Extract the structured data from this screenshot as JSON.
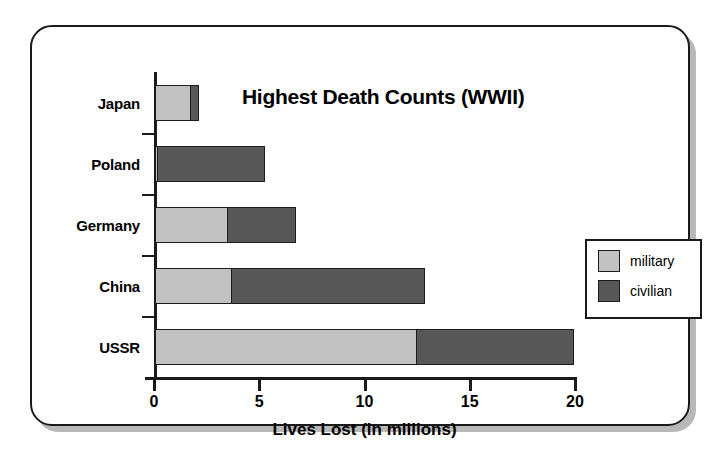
{
  "chart_data": {
    "type": "bar",
    "orientation": "horizontal",
    "stacked": true,
    "title": "Highest Death Counts (WWII)",
    "xlabel": "Lives Lost (in millions)",
    "ylabel": "",
    "categories": [
      "Japan",
      "Poland",
      "Germany",
      "China",
      "USSR"
    ],
    "series": [
      {
        "name": "military",
        "color": "#c2c2c2",
        "values": [
          1.75,
          0.2,
          3.5,
          3.7,
          12.5
        ]
      },
      {
        "name": "civilian",
        "color": "#575757",
        "values": [
          0.45,
          5.1,
          3.3,
          9.2,
          7.5
        ]
      }
    ],
    "totals": [
      2.2,
      5.3,
      6.8,
      12.9,
      20.0
    ],
    "xlim": [
      0,
      20
    ],
    "xticks": [
      0,
      5,
      10,
      15,
      20
    ],
    "xtick_labels": [
      "0",
      "5",
      "10",
      "15",
      "20"
    ],
    "grid": false,
    "legend_position": "right"
  },
  "legend": {
    "entries": [
      {
        "label": "military",
        "color": "#c2c2c2"
      },
      {
        "label": "civilian",
        "color": "#575757"
      }
    ]
  },
  "colors": {
    "military": "#c2c2c2",
    "civilian": "#575757",
    "outline": "#1a1a1a",
    "background": "#ffffff"
  }
}
